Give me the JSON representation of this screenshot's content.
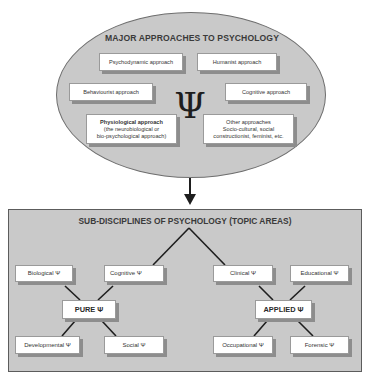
{
  "approaches": {
    "title": "MAJOR APPROACHES TO PSYCHOLOGY",
    "symbol": "Ψ",
    "items": [
      {
        "id": "psychodynamic",
        "label": "Psychodynamic approach"
      },
      {
        "id": "humanist",
        "label": "Humanist approach"
      },
      {
        "id": "behaviourist",
        "label": "Behaviourist approach"
      },
      {
        "id": "cognitive",
        "label": "Cognitive approach"
      },
      {
        "id": "physiological",
        "label": "Physiological approach",
        "detail_1": "(the neurobiological  or",
        "detail_2": "bio-psychological approach)"
      },
      {
        "id": "other",
        "label": "Other approaches",
        "detail_1": "Socio-cultural, social",
        "detail_2": "constructionist, feminist, etc."
      }
    ]
  },
  "connector": {
    "from": "MAJOR APPROACHES TO PSYCHOLOGY",
    "to": "SUB-DISCIPLINES OF PSYCHOLOGY (TOPIC AREAS)",
    "type": "down-arrow"
  },
  "subdisciplines": {
    "title": "SUB-DISCIPLINES OF PSYCHOLOGY (TOPIC AREAS)",
    "pure": {
      "label": "PURE Ψ",
      "children": [
        {
          "id": "biological",
          "label": "Biological Ψ"
        },
        {
          "id": "cognitive",
          "label": "Cognitive Ψ"
        },
        {
          "id": "developmental",
          "label": "Developmental Ψ"
        },
        {
          "id": "social",
          "label": "Social Ψ"
        }
      ]
    },
    "applied": {
      "label": "APPLIED Ψ",
      "children": [
        {
          "id": "clinical",
          "label": "Clinical Ψ"
        },
        {
          "id": "educational",
          "label": "Educational Ψ"
        },
        {
          "id": "occupational",
          "label": "Occupational Ψ"
        },
        {
          "id": "forensic",
          "label": "Forensic Ψ"
        }
      ]
    }
  },
  "colors": {
    "fill_gray": "#c9c9c9",
    "box_white": "#ffffff",
    "line_dark": "#1e1e1e",
    "shadow_gray": "#8d8d8d"
  }
}
